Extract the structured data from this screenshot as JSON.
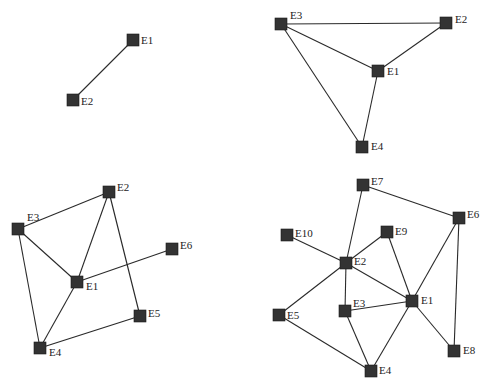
{
  "diagram": {
    "title": "",
    "node_size": 12,
    "colors": {
      "node": "#333333",
      "edge": "#2a2a2a",
      "label": "#222222",
      "background": "#ffffff"
    },
    "graphs": [
      {
        "id": "graph-1",
        "nodes": [
          {
            "id": "E1",
            "label": "E1",
            "x": 133,
            "y": 40,
            "lx": 8,
            "ly": 4
          },
          {
            "id": "E2",
            "label": "E2",
            "x": 73,
            "y": 100,
            "lx": 8,
            "ly": 5
          }
        ],
        "edges": [
          [
            "E1",
            "E2"
          ]
        ]
      },
      {
        "id": "graph-2",
        "nodes": [
          {
            "id": "E3",
            "label": "E3",
            "x": 281,
            "y": 24,
            "lx": 9,
            "ly": -5
          },
          {
            "id": "E2",
            "label": "E2",
            "x": 446,
            "y": 23,
            "lx": 9,
            "ly": 0
          },
          {
            "id": "E1",
            "label": "E1",
            "x": 378,
            "y": 71,
            "lx": 9,
            "ly": 4
          },
          {
            "id": "E4",
            "label": "E4",
            "x": 362,
            "y": 147,
            "lx": 9,
            "ly": 3
          }
        ],
        "edges": [
          [
            "E3",
            "E2"
          ],
          [
            "E3",
            "E1"
          ],
          [
            "E2",
            "E1"
          ],
          [
            "E1",
            "E4"
          ],
          [
            "E3",
            "E4"
          ]
        ]
      },
      {
        "id": "graph-3",
        "nodes": [
          {
            "id": "E2",
            "label": "E2",
            "x": 109,
            "y": 192,
            "lx": 8,
            "ly": -1
          },
          {
            "id": "E3",
            "label": "E3",
            "x": 18,
            "y": 229,
            "lx": 9,
            "ly": -8
          },
          {
            "id": "E6",
            "label": "E6",
            "x": 172,
            "y": 249,
            "lx": 8,
            "ly": 0
          },
          {
            "id": "E1",
            "label": "E1",
            "x": 77,
            "y": 282,
            "lx": 9,
            "ly": 8
          },
          {
            "id": "E5",
            "label": "E5",
            "x": 140,
            "y": 316,
            "lx": 8,
            "ly": 1
          },
          {
            "id": "E4",
            "label": "E4",
            "x": 40,
            "y": 348,
            "lx": 9,
            "ly": 8
          }
        ],
        "edges": [
          [
            "E3",
            "E2"
          ],
          [
            "E2",
            "E1"
          ],
          [
            "E2",
            "E5"
          ],
          [
            "E3",
            "E1"
          ],
          [
            "E3",
            "E4"
          ],
          [
            "E1",
            "E6"
          ],
          [
            "E1",
            "E4"
          ],
          [
            "E4",
            "E5"
          ]
        ]
      },
      {
        "id": "graph-4",
        "nodes": [
          {
            "id": "E7",
            "label": "E7",
            "x": 363,
            "y": 185,
            "lx": 8,
            "ly": 0
          },
          {
            "id": "E6",
            "label": "E6",
            "x": 459,
            "y": 218,
            "lx": 8,
            "ly": 0
          },
          {
            "id": "E10",
            "label": "E10",
            "x": 287,
            "y": 235,
            "lx": 8,
            "ly": 2
          },
          {
            "id": "E9",
            "label": "E9",
            "x": 387,
            "y": 232,
            "lx": 8,
            "ly": 3
          },
          {
            "id": "E2",
            "label": "E2",
            "x": 346,
            "y": 263,
            "lx": 8,
            "ly": 2
          },
          {
            "id": "E1",
            "label": "E1",
            "x": 412,
            "y": 301,
            "lx": 9,
            "ly": 3
          },
          {
            "id": "E3",
            "label": "E3",
            "x": 345,
            "y": 311,
            "lx": 8,
            "ly": -4
          },
          {
            "id": "E5",
            "label": "E5",
            "x": 279,
            "y": 315,
            "lx": 8,
            "ly": 4
          },
          {
            "id": "E8",
            "label": "E8",
            "x": 454,
            "y": 351,
            "lx": 9,
            "ly": 3
          },
          {
            "id": "E4",
            "label": "E4",
            "x": 371,
            "y": 371,
            "lx": 8,
            "ly": 3
          }
        ],
        "edges": [
          [
            "E7",
            "E2"
          ],
          [
            "E7",
            "E6"
          ],
          [
            "E10",
            "E2"
          ],
          [
            "E9",
            "E2"
          ],
          [
            "E9",
            "E1"
          ],
          [
            "E2",
            "E1"
          ],
          [
            "E2",
            "E3"
          ],
          [
            "E2",
            "E5"
          ],
          [
            "E3",
            "E1"
          ],
          [
            "E3",
            "E4"
          ],
          [
            "E5",
            "E4"
          ],
          [
            "E1",
            "E4"
          ],
          [
            "E1",
            "E6"
          ],
          [
            "E1",
            "E8"
          ],
          [
            "E6",
            "E8"
          ]
        ]
      }
    ]
  }
}
